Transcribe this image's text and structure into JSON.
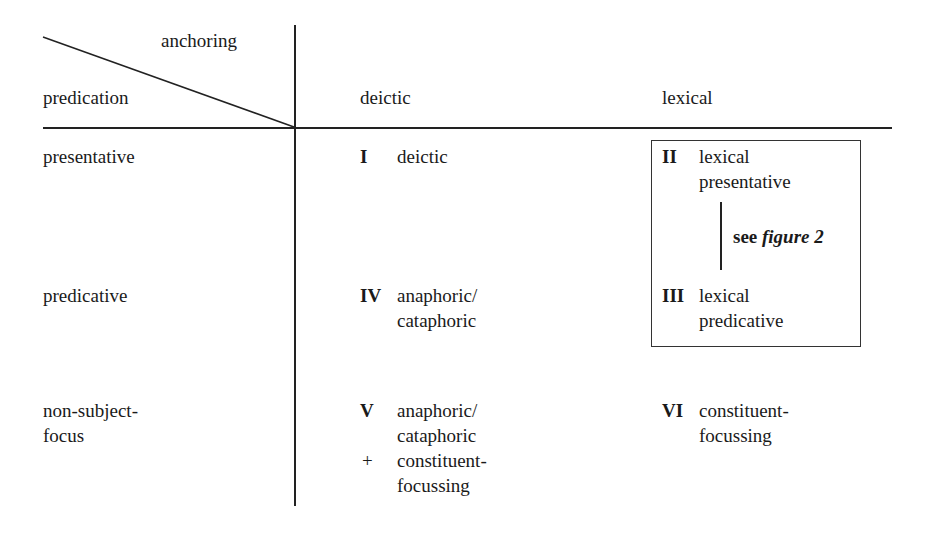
{
  "header": {
    "column_axis_label": "anchoring",
    "row_axis_label": "predication",
    "columns": [
      "deictic",
      "lexical"
    ]
  },
  "rows": [
    {
      "label": [
        "presentative"
      ]
    },
    {
      "label": [
        "predicative"
      ]
    },
    {
      "label": [
        "non-subject-",
        "focus"
      ]
    }
  ],
  "cells": [
    {
      "id": "I",
      "lines": [
        "deictic"
      ]
    },
    {
      "id": "II",
      "lines": [
        "lexical",
        "presentative"
      ]
    },
    {
      "id": "III",
      "lines": [
        "lexical",
        "predicative"
      ]
    },
    {
      "id": "IV",
      "lines": [
        "anaphoric/",
        "cataphoric"
      ]
    },
    {
      "id": "V",
      "lines": [
        "anaphoric/",
        "cataphoric",
        "constituent-",
        "focussing"
      ],
      "plus_marker": "+"
    },
    {
      "id": "VI",
      "lines": [
        "constituent-",
        "focussing"
      ]
    }
  ],
  "box_note": {
    "prefix": "see",
    "ref": "figure 2"
  }
}
